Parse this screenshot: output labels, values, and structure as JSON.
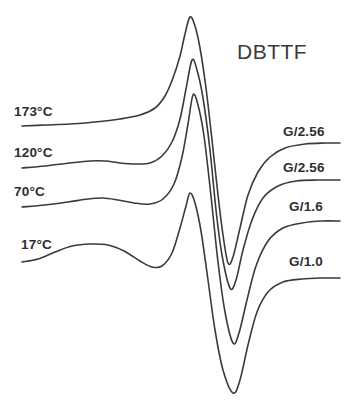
{
  "figure": {
    "title": "DBTTF",
    "background_color": "#ffffff",
    "line_color": "#3a3a3a",
    "text_color": "#2e2e2e"
  },
  "left_labels": [
    {
      "id": "t173",
      "text": "173°C"
    },
    {
      "id": "t120",
      "text": "120°C"
    },
    {
      "id": "t70",
      "text": "70°C"
    },
    {
      "id": "t17",
      "text": "17°C"
    }
  ],
  "right_labels": [
    {
      "id": "g1",
      "text": "G/2.56"
    },
    {
      "id": "g2",
      "text": "G/2.56"
    },
    {
      "id": "g3",
      "text": "G/1.6"
    },
    {
      "id": "g4",
      "text": "G/1.0"
    }
  ],
  "chart_data": {
    "type": "line",
    "title": "DBTTF",
    "xlabel": "",
    "ylabel": "",
    "grid": false,
    "legend": "inline-curve-labels",
    "series": [
      {
        "name": "173°C",
        "temperature": "173°C",
        "gain": "G/2.56",
        "baseline_y": 126,
        "peak": {
          "x": 190,
          "y": 17
        },
        "trough": {
          "x": 228,
          "y": 263
        },
        "tail_y": 143,
        "points": [
          [
            22,
            126
          ],
          [
            45,
            125
          ],
          [
            70,
            124
          ],
          [
            95,
            122
          ],
          [
            120,
            119
          ],
          [
            140,
            115
          ],
          [
            155,
            108
          ],
          [
            165,
            96
          ],
          [
            173,
            78
          ],
          [
            180,
            56
          ],
          [
            185,
            34
          ],
          [
            190,
            17
          ],
          [
            195,
            26
          ],
          [
            200,
            48
          ],
          [
            206,
            88
          ],
          [
            212,
            140
          ],
          [
            218,
            195
          ],
          [
            223,
            235
          ],
          [
            228,
            263
          ],
          [
            233,
            257
          ],
          [
            240,
            228
          ],
          [
            248,
            195
          ],
          [
            258,
            172
          ],
          [
            270,
            157
          ],
          [
            285,
            148
          ],
          [
            305,
            144
          ],
          [
            325,
            143
          ],
          [
            340,
            143
          ]
        ]
      },
      {
        "name": "120°C",
        "temperature": "120°C",
        "gain": "G/2.56",
        "baseline_y": 168,
        "peak": {
          "x": 192,
          "y": 60
        },
        "trough": {
          "x": 230,
          "y": 288
        },
        "tail_y": 180,
        "points": [
          [
            22,
            168
          ],
          [
            45,
            166
          ],
          [
            70,
            163
          ],
          [
            90,
            161
          ],
          [
            105,
            161
          ],
          [
            120,
            163
          ],
          [
            135,
            164
          ],
          [
            150,
            163
          ],
          [
            162,
            156
          ],
          [
            172,
            142
          ],
          [
            180,
            119
          ],
          [
            186,
            89
          ],
          [
            192,
            60
          ],
          [
            197,
            70
          ],
          [
            203,
            98
          ],
          [
            210,
            150
          ],
          [
            216,
            210
          ],
          [
            222,
            255
          ],
          [
            230,
            288
          ],
          [
            236,
            280
          ],
          [
            243,
            250
          ],
          [
            252,
            220
          ],
          [
            263,
            198
          ],
          [
            278,
            186
          ],
          [
            296,
            181
          ],
          [
            318,
            180
          ],
          [
            340,
            180
          ]
        ]
      },
      {
        "name": "70°C",
        "temperature": "70°C",
        "gain": "G/1.6",
        "baseline_y": 207,
        "peak": {
          "x": 193,
          "y": 95
        },
        "trough": {
          "x": 233,
          "y": 343
        },
        "tail_y": 221,
        "points": [
          [
            22,
            207
          ],
          [
            45,
            205
          ],
          [
            68,
            202
          ],
          [
            88,
            199
          ],
          [
            103,
            198
          ],
          [
            118,
            200
          ],
          [
            134,
            203
          ],
          [
            150,
            204
          ],
          [
            163,
            199
          ],
          [
            174,
            184
          ],
          [
            182,
            157
          ],
          [
            188,
            124
          ],
          [
            193,
            95
          ],
          [
            198,
            105
          ],
          [
            204,
            136
          ],
          [
            211,
            196
          ],
          [
            218,
            262
          ],
          [
            225,
            312
          ],
          [
            233,
            343
          ],
          [
            239,
            333
          ],
          [
            247,
            300
          ],
          [
            256,
            266
          ],
          [
            268,
            241
          ],
          [
            283,
            228
          ],
          [
            302,
            223
          ],
          [
            322,
            221
          ],
          [
            340,
            221
          ]
        ]
      },
      {
        "name": "17°C",
        "temperature": "17°C",
        "gain": "G/1.0",
        "baseline_y": 262,
        "broad_hump": {
          "x": 90,
          "y": 245
        },
        "shoulder_dip": {
          "x": 155,
          "y": 268
        },
        "peak": {
          "x": 190,
          "y": 193
        },
        "trough": {
          "x": 233,
          "y": 393
        },
        "tail_y": 278,
        "points": [
          [
            22,
            262
          ],
          [
            38,
            259
          ],
          [
            55,
            252
          ],
          [
            72,
            246
          ],
          [
            90,
            244
          ],
          [
            108,
            245
          ],
          [
            124,
            251
          ],
          [
            140,
            261
          ],
          [
            152,
            267
          ],
          [
            162,
            266
          ],
          [
            172,
            253
          ],
          [
            180,
            228
          ],
          [
            186,
            206
          ],
          [
            190,
            193
          ],
          [
            195,
            203
          ],
          [
            201,
            231
          ],
          [
            208,
            280
          ],
          [
            215,
            330
          ],
          [
            223,
            370
          ],
          [
            233,
            393
          ],
          [
            240,
            380
          ],
          [
            248,
            345
          ],
          [
            257,
            312
          ],
          [
            268,
            292
          ],
          [
            283,
            282
          ],
          [
            302,
            279
          ],
          [
            322,
            278
          ],
          [
            340,
            278
          ]
        ]
      }
    ]
  }
}
